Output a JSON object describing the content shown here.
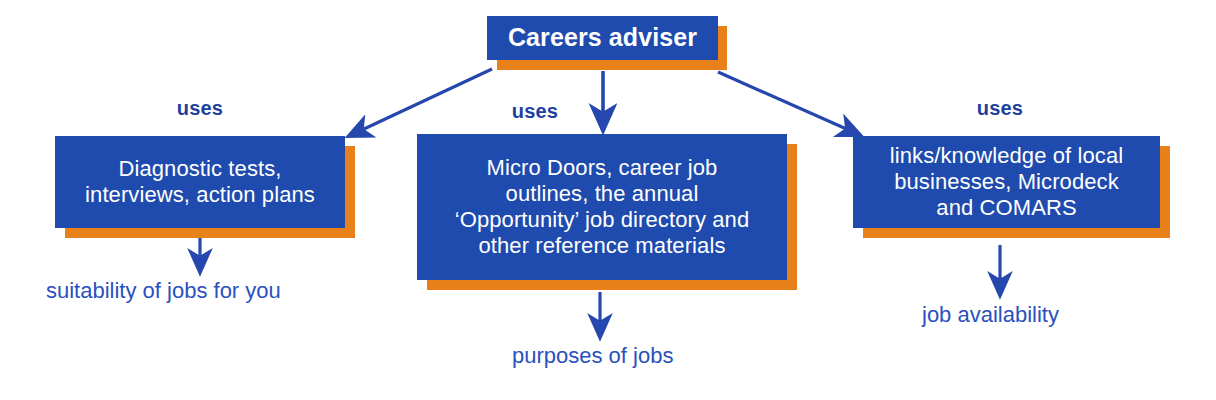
{
  "diagram": {
    "title": "Careers adviser",
    "relation_label": "uses",
    "colors": {
      "box_fill": "#1e4bad",
      "box_shadow": "#e8811a",
      "box_text": "#ffffff",
      "arrow": "#2647ad",
      "label_text": "#1e3fa0",
      "outcome_text": "#2a51bd",
      "background": "#ffffff"
    },
    "root": {
      "label": "Careers adviser"
    },
    "branches": [
      {
        "relation": "uses",
        "resource_lines": [
          "Diagnostic tests,",
          "interviews, action plans"
        ],
        "resource_text": "Diagnostic tests, interviews, action plans",
        "outcome": "suitability of jobs for you"
      },
      {
        "relation": "uses",
        "resource_lines": [
          "Micro Doors, career job",
          "outlines, the annual",
          "‘Opportunity’ job directory and",
          "other reference materials"
        ],
        "resource_text": "Micro Doors, career job outlines, the annual ‘Opportunity’ job directory and other reference materials",
        "outcome": "purposes of jobs"
      },
      {
        "relation": "uses",
        "resource_lines": [
          "links/knowledge of local",
          "businesses, Microdeck",
          "and COMARS"
        ],
        "resource_text": "links/knowledge of local businesses, Microdeck and COMARS",
        "outcome": "job availability"
      }
    ]
  }
}
